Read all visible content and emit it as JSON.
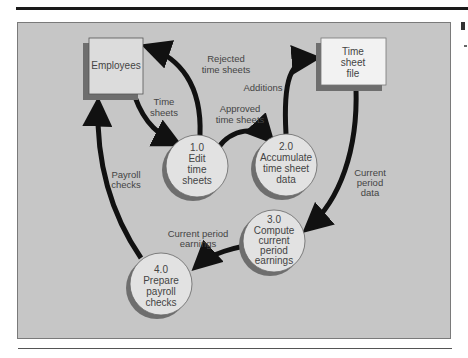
{
  "diagram": {
    "type": "data-flow-diagram",
    "colors": {
      "panel_background": "#c6c6c6",
      "external_entity_fill": "#dcdcdc",
      "data_store_fill": "#f2f2f2",
      "process_fill": "#e2e2e2",
      "shadow": "#6e6e6e",
      "arrow": "#111111",
      "text": "#444444"
    },
    "entities": [
      {
        "id": "employees",
        "kind": "external-entity",
        "label": "Employees"
      },
      {
        "id": "time-sheet-file",
        "kind": "data-store",
        "lines": [
          "Time",
          "sheet",
          "file"
        ]
      }
    ],
    "processes": [
      {
        "id": "p1",
        "lines": [
          "1.0",
          "Edit",
          "time",
          "sheets"
        ]
      },
      {
        "id": "p2",
        "lines": [
          "2.0",
          "Accumulate",
          "time sheet",
          "data"
        ]
      },
      {
        "id": "p3",
        "lines": [
          "3.0",
          "Compute",
          "current",
          "period",
          "earnings"
        ]
      },
      {
        "id": "p4",
        "lines": [
          "4.0",
          "Prepare",
          "payroll",
          "checks"
        ]
      }
    ],
    "flows": [
      {
        "id": "f1",
        "from": "employees",
        "to": "p1",
        "lines": [
          "Time",
          "sheets"
        ]
      },
      {
        "id": "f2",
        "from": "p1",
        "to": "employees",
        "lines": [
          "Rejected",
          "time sheets"
        ]
      },
      {
        "id": "f3",
        "from": "p1",
        "to": "p2",
        "lines": [
          "Approved",
          "time sheets"
        ]
      },
      {
        "id": "f4",
        "from": "p2",
        "to": "time-sheet-file",
        "lines": [
          "Additions"
        ]
      },
      {
        "id": "f5",
        "from": "time-sheet-file",
        "to": "p3",
        "lines": [
          "Current",
          "period",
          "data"
        ]
      },
      {
        "id": "f6",
        "from": "p3",
        "to": "p4",
        "lines": [
          "Current period",
          "earnings"
        ]
      },
      {
        "id": "f7",
        "from": "p4",
        "to": "employees",
        "lines": [
          "Payroll",
          "checks"
        ]
      }
    ]
  }
}
